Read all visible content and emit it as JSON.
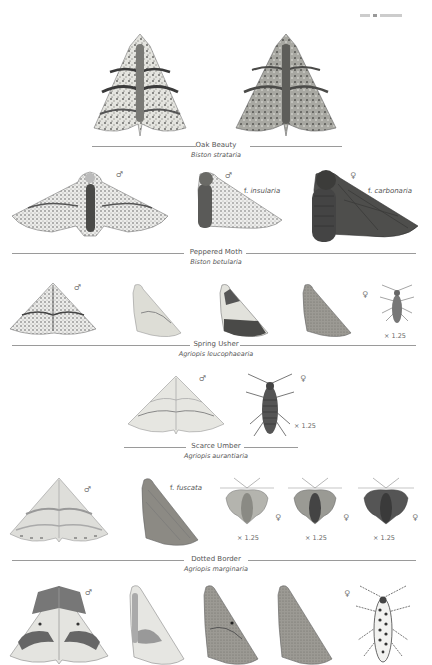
{
  "page_header": {
    "running_head": ""
  },
  "colors": {
    "text": "#555555",
    "rule": "#9a9a9a",
    "moth_light": "#d9d9d4",
    "moth_mid": "#8f8f8a",
    "moth_dark": "#4a4a48",
    "moth_black": "#3a3a3a"
  },
  "species": [
    {
      "common_name": "Oak Beauty",
      "scientific_name": "Biston strataria",
      "figures": [
        {
          "id": "oak-beauty-1",
          "view": "spread",
          "tone": "pale-marbled"
        },
        {
          "id": "oak-beauty-2",
          "view": "spread",
          "tone": "grey-marbled"
        }
      ]
    },
    {
      "common_name": "Peppered Moth",
      "scientific_name": "Biston betularia",
      "figures": [
        {
          "id": "peppered-typical",
          "view": "spread",
          "sex": "♂",
          "tone": "peppered-white"
        },
        {
          "id": "peppered-insularia",
          "view": "resting",
          "sex": "♂",
          "form": "f.",
          "form_name": "insularia"
        },
        {
          "id": "peppered-carbonaria",
          "view": "resting",
          "sex": "♀",
          "form": "f.",
          "form_name": "carbonaria"
        }
      ]
    },
    {
      "common_name": "Spring Usher",
      "scientific_name": "Agriopis leucophaearia",
      "figures": [
        {
          "id": "spring-usher-spread",
          "view": "spread",
          "sex": "♂"
        },
        {
          "id": "spring-usher-rest-pale",
          "view": "resting"
        },
        {
          "id": "spring-usher-rest-banded",
          "view": "resting"
        },
        {
          "id": "spring-usher-rest-dark",
          "view": "resting"
        },
        {
          "id": "spring-usher-female",
          "view": "wingless",
          "sex": "♀",
          "scale": "× 1.25"
        }
      ]
    },
    {
      "common_name": "Scarce Umber",
      "scientific_name": "Agriopis aurantiaria",
      "figures": [
        {
          "id": "scarce-umber-male",
          "view": "spread",
          "sex": "♂"
        },
        {
          "id": "scarce-umber-female",
          "view": "wingless",
          "sex": "♀",
          "scale": "× 1.25"
        }
      ]
    },
    {
      "common_name": "Dotted Border",
      "scientific_name": "Agriopis marginaria",
      "figures": [
        {
          "id": "dotted-border-male",
          "view": "spread",
          "sex": "♂"
        },
        {
          "id": "dotted-border-fuscata",
          "view": "resting",
          "form": "f.",
          "form_name": "fuscata"
        },
        {
          "id": "dotted-border-female-1",
          "view": "short-winged",
          "sex": "♀",
          "scale": "× 1.25"
        },
        {
          "id": "dotted-border-female-2",
          "view": "short-winged",
          "sex": "♀",
          "scale": "× 1.25"
        },
        {
          "id": "dotted-border-female-3",
          "view": "short-winged",
          "sex": "♀",
          "scale": "× 1.25"
        }
      ]
    },
    {
      "common_name": "",
      "scientific_name": "",
      "figures": [
        {
          "id": "row6-spread",
          "view": "spread",
          "sex": "♂"
        },
        {
          "id": "row6-rest-pale",
          "view": "resting"
        },
        {
          "id": "row6-rest-mid",
          "view": "resting"
        },
        {
          "id": "row6-rest-plain",
          "view": "resting"
        },
        {
          "id": "row6-female",
          "view": "wingless",
          "sex": "♀"
        }
      ]
    }
  ]
}
